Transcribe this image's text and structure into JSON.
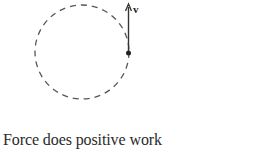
{
  "diagram": {
    "orbit": {
      "shape": "dashed-circle",
      "center": [
        82,
        52
      ],
      "radius": 47,
      "color": "#555555"
    },
    "particle": {
      "position": [
        128,
        53
      ],
      "color": "#222222"
    },
    "velocity_vector": {
      "label": "v",
      "from": [
        128,
        53
      ],
      "to": [
        128,
        4
      ],
      "color": "#333333"
    }
  },
  "caption": "Force does positive work"
}
